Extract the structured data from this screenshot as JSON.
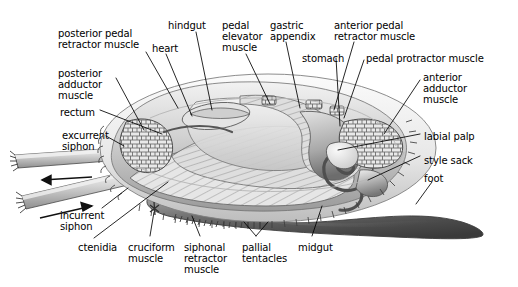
{
  "figure": {
    "background_color": "#ffffff",
    "ink_color": "#000000",
    "width": 518,
    "height": 287
  },
  "labels": [
    {
      "id": "posterior-pedal-retractor-muscle",
      "text": "posterior pedal\nretractor muscle",
      "x": 58,
      "y": 28,
      "align": "left"
    },
    {
      "id": "hindgut",
      "text": "hindgut",
      "x": 168,
      "y": 20,
      "align": "left"
    },
    {
      "id": "heart",
      "text": "heart",
      "x": 152,
      "y": 43,
      "align": "left"
    },
    {
      "id": "pedal-elevator-muscle",
      "text": "pedal\nelevator\nmuscle",
      "x": 222,
      "y": 20,
      "align": "left"
    },
    {
      "id": "gastric-appendix",
      "text": "gastric\nappendix",
      "x": 270,
      "y": 20,
      "align": "left"
    },
    {
      "id": "anterior-pedal-retractor-muscle",
      "text": "anterior pedal\nretractor muscle",
      "x": 334,
      "y": 20,
      "align": "left"
    },
    {
      "id": "stomach",
      "text": "stomach",
      "x": 302,
      "y": 53,
      "align": "left"
    },
    {
      "id": "pedal-protractor-muscle",
      "text": "pedal protractor muscle",
      "x": 366,
      "y": 53,
      "align": "left"
    },
    {
      "id": "anterior-adductor-muscle",
      "text": "anterior\nadductor\nmuscle",
      "x": 423,
      "y": 72,
      "align": "left"
    },
    {
      "id": "posterior-adductor-muscle",
      "text": "posterior\nadductor\nmuscle",
      "x": 58,
      "y": 68,
      "align": "left"
    },
    {
      "id": "rectum",
      "text": "rectum",
      "x": 60,
      "y": 107,
      "align": "left"
    },
    {
      "id": "excurrent-siphon",
      "text": "excurrent\nsiphon",
      "x": 62,
      "y": 130,
      "align": "left"
    },
    {
      "id": "labial-palp",
      "text": "labial palp",
      "x": 424,
      "y": 131,
      "align": "left"
    },
    {
      "id": "style-sack",
      "text": "style sack",
      "x": 424,
      "y": 155,
      "align": "left"
    },
    {
      "id": "foot",
      "text": "foot",
      "x": 424,
      "y": 173,
      "align": "left"
    },
    {
      "id": "incurrent-siphon",
      "text": "incurrent\nsiphon",
      "x": 60,
      "y": 210,
      "align": "left"
    },
    {
      "id": "ctenidia",
      "text": "ctenidia",
      "x": 78,
      "y": 242,
      "align": "left"
    },
    {
      "id": "cruciform-muscle",
      "text": "cruciform\nmuscle",
      "x": 128,
      "y": 242,
      "align": "left"
    },
    {
      "id": "siphonal-retractor-muscle",
      "text": "siphonal\nretractor\nmuscle",
      "x": 184,
      "y": 242,
      "align": "left"
    },
    {
      "id": "pallial-tentacles",
      "text": "pallial\ntentacles",
      "x": 242,
      "y": 242,
      "align": "left"
    },
    {
      "id": "midgut",
      "text": "midgut",
      "x": 298,
      "y": 242,
      "align": "left"
    }
  ],
  "flow_arrows": [
    {
      "id": "excurrent-flow-arrow",
      "direction": "left",
      "meaning": "water exits via excurrent siphon"
    },
    {
      "id": "incurrent-flow-arrow",
      "direction": "right",
      "meaning": "water enters via incurrent siphon"
    }
  ]
}
